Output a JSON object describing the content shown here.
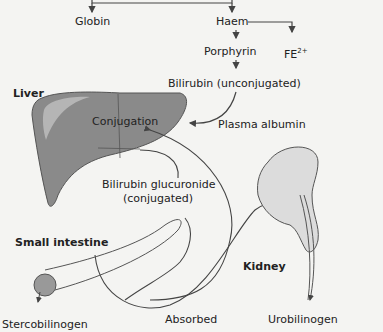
{
  "diagram": {
    "title_region": "Bilirubin metabolism",
    "nodes": {
      "globin": "Globin",
      "haem": "Haem",
      "porphyrin": "Porphyrin",
      "iron": "FE",
      "iron_sup": "2+",
      "bilirubin_unconj": "Bilirubin (unconjugated)",
      "plasma_albumin": "Plasma albumin",
      "conjugation": "Conjugation",
      "bilirubin_gluc_1": "Bilirubin glucuronide",
      "bilirubin_gluc_2": "(conjugated)",
      "absorbed": "Absorbed",
      "stercobilinogen": "Stercobilinogen",
      "urobilinogen": "Urobilinogen"
    },
    "organs": {
      "liver": "Liver",
      "small_intestine": "Small intestine",
      "kidney": "Kidney"
    },
    "colors": {
      "background": "#f4f4f2",
      "liver_fill": "#8a8a8a",
      "kidney_fill": "#d8d8d8",
      "line": "#444444"
    }
  }
}
